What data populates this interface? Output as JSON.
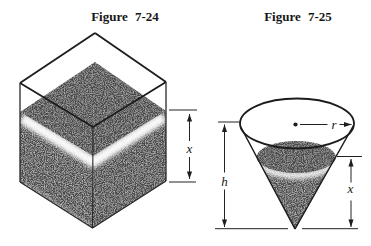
{
  "figure_24": {
    "title": "Figure 7-24",
    "labels": {
      "depth": "x"
    }
  },
  "figure_25": {
    "title": "Figure 7-25",
    "labels": {
      "radius": "r",
      "height": "h",
      "depth": "x"
    }
  },
  "colors": {
    "ink": "#1c1c1c",
    "stipple": "#9a9a9a",
    "paper": "#ffffff"
  }
}
